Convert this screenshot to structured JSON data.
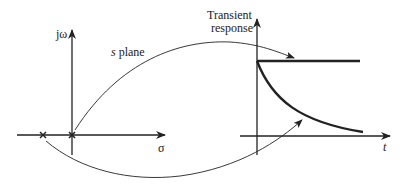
{
  "diagram": {
    "s_plane": {
      "label": "s plane",
      "vertical_axis_label": "jω",
      "horizontal_axis_label": "σ",
      "poles": [
        {
          "name": "pole-at-origin",
          "position": "origin"
        },
        {
          "name": "pole-negative-real",
          "position": "left of origin"
        }
      ]
    },
    "response": {
      "title_line1": "Transient",
      "title_line2": "response",
      "time_axis_label": "t",
      "curves": [
        {
          "name": "step-response",
          "shape": "constant"
        },
        {
          "name": "decaying-response",
          "shape": "exponential decay"
        }
      ]
    },
    "arrows": [
      {
        "from": "pole-at-origin",
        "to": "step-response"
      },
      {
        "from": "pole-negative-real",
        "to": "decaying-response"
      }
    ],
    "colors": {
      "ink": "#222222",
      "background": "#ffffff"
    }
  }
}
